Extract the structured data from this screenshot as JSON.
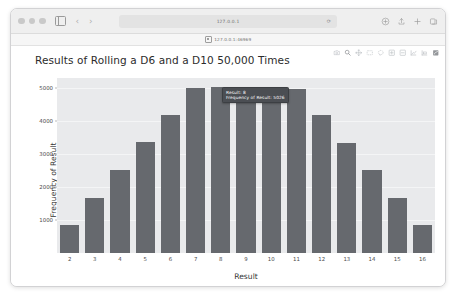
{
  "browser": {
    "url": "127.0.0.1",
    "reload_glyph": "⟳",
    "back_glyph": "‹",
    "forward_glyph": "›",
    "bookmark_label": "127.0.0.1:46969",
    "icons": {
      "sidebar": "sidebar-icon",
      "appearance": "appearance-toggle-icon",
      "share": "share-icon",
      "new_tab": "new-tab-icon",
      "tab_overview": "tab-overview-icon",
      "extensions": "extensions-icon"
    }
  },
  "modebar": {
    "buttons": [
      {
        "name": "camera-icon",
        "label": "Download plot as a png"
      },
      {
        "name": "zoom-icon",
        "label": "Zoom"
      },
      {
        "name": "pan-icon",
        "label": "Pan"
      },
      {
        "name": "zoom-box-icon",
        "label": "Box Select"
      },
      {
        "name": "lasso-icon",
        "label": "Lasso Select"
      },
      {
        "name": "zoom-in-icon",
        "label": "Zoom in"
      },
      {
        "name": "zoom-out-icon",
        "label": "Zoom out"
      },
      {
        "name": "autoscale-icon",
        "label": "Autoscale"
      },
      {
        "name": "reset-axes-icon",
        "label": "Reset axes"
      },
      {
        "name": "plotly-logo-icon",
        "label": "Produced with Plotly"
      }
    ]
  },
  "tooltip": {
    "result_line": "Result: 8",
    "frequency_line": "Frequency of Result: 5026"
  },
  "chart_data": {
    "type": "bar",
    "title": "Results of Rolling a D6 and a D10 50,000 Times",
    "xlabel": "Result",
    "ylabel": "Frequency of Result",
    "categories": [
      2,
      3,
      4,
      5,
      6,
      7,
      8,
      9,
      10,
      11,
      12,
      13,
      14,
      15,
      16
    ],
    "values": [
      844,
      1670,
      2514,
      3349,
      4191,
      4988,
      5026,
      4964,
      4978,
      4980,
      4186,
      3345,
      2522,
      1671,
      838
    ],
    "ytick_labels": [
      "1000",
      "2000",
      "3000",
      "4000",
      "5000"
    ],
    "ytick_values": [
      1000,
      2000,
      3000,
      4000,
      5000
    ],
    "ylim": [
      0,
      5300
    ],
    "grid": true,
    "legend": "none",
    "bar_color": "#66696e",
    "plot_bgcolor": "#e9eaec",
    "paper_bgcolor": "#ffffff"
  }
}
